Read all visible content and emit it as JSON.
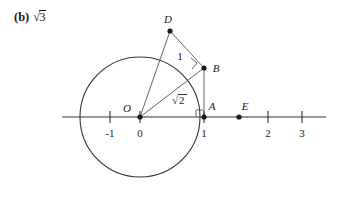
{
  "part": {
    "enumerator": "(b)",
    "answer_prefix": "√",
    "answer_radicand": "3",
    "answer_text": "√3"
  },
  "figure": {
    "caption_points": [
      {
        "name": "O",
        "label": "O",
        "x": 0,
        "y": 0
      },
      {
        "name": "A",
        "label": "A",
        "x": 1,
        "y": 0
      },
      {
        "name": "B",
        "label": "B",
        "x": 1,
        "y": 1.41421356
      },
      {
        "name": "D",
        "label": "D",
        "x": 0,
        "y": 1.73205081
      },
      {
        "name": "E",
        "label": "E",
        "x": 1.73205081,
        "y": 0
      }
    ],
    "segment_labels": [
      {
        "name": "segment-DB",
        "text": "1",
        "from": "D",
        "to": "B"
      },
      {
        "name": "segment-OB",
        "text": "√2",
        "radicand": "2",
        "from": "O",
        "to": "B"
      }
    ],
    "right_angle_marks": [
      {
        "name": "right-angle-at-A",
        "vertex": "A"
      },
      {
        "name": "right-angle-at-B",
        "vertex": "B"
      }
    ],
    "circle": {
      "center_label": "O",
      "radius_value": "√3",
      "center_x": 0,
      "center_y": 0,
      "radius": 1.73205081
    },
    "axis": {
      "tick_labels": [
        "-1",
        "0",
        "1",
        "2",
        "3"
      ],
      "tick_values": [
        -1,
        0,
        1,
        2,
        3
      ],
      "min": -2.4,
      "max": 5.8
    }
  },
  "colors": {
    "ink": "#1a1a1a",
    "stroke": "#333333",
    "background": "#ffffff"
  }
}
